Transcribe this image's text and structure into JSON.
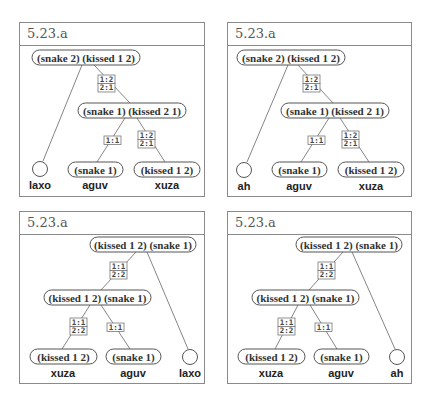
{
  "panels": [
    {
      "title": "5.23.a",
      "box": {
        "x": 19,
        "y": 22,
        "w": 186,
        "h": 175
      },
      "nodes": [
        {
          "id": "top",
          "label": "(snake 2) (kissed 1 2)",
          "x": 32,
          "y": 50,
          "w": 108,
          "h": 15
        },
        {
          "id": "mid",
          "label": "(snake 1) (kissed 2 1)",
          "x": 78,
          "y": 103,
          "w": 108,
          "h": 15
        },
        {
          "id": "b1",
          "label": "(snake 1)",
          "x": 68,
          "y": 162,
          "w": 55,
          "h": 15
        },
        {
          "id": "b2",
          "label": "(kissed 1 2)",
          "x": 134,
          "y": 162,
          "w": 66,
          "h": 15
        }
      ],
      "leaf": {
        "cx": 40,
        "cy": 169,
        "r": 7.5
      },
      "edges": [
        {
          "from": [
            82,
            65
          ],
          "to": [
            43,
            161
          ]
        },
        {
          "from": [
            94,
            65
          ],
          "to": [
            130,
            103
          ]
        },
        {
          "from": [
            125,
            118
          ],
          "to": [
            97,
            162
          ]
        },
        {
          "from": [
            137,
            118
          ],
          "to": [
            165,
            162
          ]
        }
      ],
      "maps": [
        {
          "x": 98,
          "y": 75,
          "lines": [
            "1:2",
            "2:1"
          ]
        },
        {
          "x": 104,
          "y": 136,
          "lines": [
            "1:1"
          ]
        },
        {
          "x": 138,
          "y": 131,
          "lines": [
            "1:2",
            "2:1"
          ]
        }
      ],
      "labels": [
        {
          "text": "laxo",
          "x": 40,
          "y": 189
        },
        {
          "text": "aguv",
          "x": 95,
          "y": 189
        },
        {
          "text": "xuza",
          "x": 167,
          "y": 189
        }
      ]
    },
    {
      "title": "5.23.a",
      "box": {
        "x": 227,
        "y": 22,
        "w": 185,
        "h": 175
      },
      "nodes": [
        {
          "id": "top",
          "label": "(snake 2) (kissed 1 2)",
          "x": 237,
          "y": 50,
          "w": 108,
          "h": 15
        },
        {
          "id": "mid",
          "label": "(snake 1) (kissed 2 1)",
          "x": 281,
          "y": 103,
          "w": 108,
          "h": 15
        },
        {
          "id": "b1",
          "label": "(snake 1)",
          "x": 272,
          "y": 162,
          "w": 55,
          "h": 15
        },
        {
          "id": "b2",
          "label": "(kissed 1 2)",
          "x": 338,
          "y": 162,
          "w": 66,
          "h": 15
        }
      ],
      "leaf": {
        "cx": 244,
        "cy": 170,
        "r": 7.5
      },
      "edges": [
        {
          "from": [
            288,
            65
          ],
          "to": [
            247,
            162
          ]
        },
        {
          "from": [
            298,
            65
          ],
          "to": [
            333,
            103
          ]
        },
        {
          "from": [
            329,
            118
          ],
          "to": [
            301,
            162
          ]
        },
        {
          "from": [
            340,
            118
          ],
          "to": [
            369,
            162
          ]
        }
      ],
      "maps": [
        {
          "x": 303,
          "y": 75,
          "lines": [
            "1:2",
            "2:1"
          ]
        },
        {
          "x": 308,
          "y": 136,
          "lines": [
            "1:1"
          ]
        },
        {
          "x": 342,
          "y": 131,
          "lines": [
            "1:2",
            "2:1"
          ]
        }
      ],
      "labels": [
        {
          "text": "ah",
          "x": 244,
          "y": 190
        },
        {
          "text": "aguv",
          "x": 299,
          "y": 190
        },
        {
          "text": "xuza",
          "x": 371,
          "y": 190
        }
      ]
    },
    {
      "title": "5.23.a",
      "box": {
        "x": 19,
        "y": 211,
        "w": 186,
        "h": 173
      },
      "nodes": [
        {
          "id": "top",
          "label": "(kissed 1 2) (snake 1)",
          "x": 90,
          "y": 237,
          "w": 106,
          "h": 15
        },
        {
          "id": "mid",
          "label": "(kissed 1 2) (snake 1)",
          "x": 44,
          "y": 290,
          "w": 107,
          "h": 15
        },
        {
          "id": "b1",
          "label": "(kissed 1 2)",
          "x": 30,
          "y": 349,
          "w": 67,
          "h": 15
        },
        {
          "id": "b2",
          "label": "(snake 1)",
          "x": 106,
          "y": 349,
          "w": 55,
          "h": 15
        }
      ],
      "leaf": {
        "cx": 190,
        "cy": 357,
        "r": 7.5
      },
      "edges": [
        {
          "from": [
            147,
            252
          ],
          "to": [
            188,
            349
          ]
        },
        {
          "from": [
            136,
            252
          ],
          "to": [
            101,
            290
          ]
        },
        {
          "from": [
            90,
            305
          ],
          "to": [
            62,
            349
          ]
        },
        {
          "from": [
            101,
            305
          ],
          "to": [
            130,
            349
          ]
        }
      ],
      "maps": [
        {
          "x": 110,
          "y": 262,
          "lines": [
            "1:1",
            "2:2"
          ]
        },
        {
          "x": 70,
          "y": 318,
          "lines": [
            "1:1",
            "2:2"
          ]
        },
        {
          "x": 107,
          "y": 323,
          "lines": [
            "1:1"
          ]
        }
      ],
      "labels": [
        {
          "text": "xuza",
          "x": 63,
          "y": 377
        },
        {
          "text": "aguv",
          "x": 133,
          "y": 377
        },
        {
          "text": "laxo",
          "x": 190,
          "y": 377
        }
      ]
    },
    {
      "title": "5.23.a",
      "box": {
        "x": 227,
        "y": 211,
        "w": 185,
        "h": 173
      },
      "nodes": [
        {
          "id": "top",
          "label": "(kissed 1 2) (snake 1)",
          "x": 296,
          "y": 237,
          "w": 106,
          "h": 15
        },
        {
          "id": "mid",
          "label": "(kissed 1 2) (snake 1)",
          "x": 252,
          "y": 290,
          "w": 107,
          "h": 15
        },
        {
          "id": "b1",
          "label": "(kissed 1 2)",
          "x": 238,
          "y": 349,
          "w": 67,
          "h": 15
        },
        {
          "id": "b2",
          "label": "(snake 1)",
          "x": 314,
          "y": 349,
          "w": 55,
          "h": 15
        }
      ],
      "leaf": {
        "cx": 397,
        "cy": 357,
        "r": 7.5
      },
      "edges": [
        {
          "from": [
            352,
            252
          ],
          "to": [
            395,
            349
          ]
        },
        {
          "from": [
            343,
            252
          ],
          "to": [
            309,
            290
          ]
        },
        {
          "from": [
            298,
            305
          ],
          "to": [
            275,
            349
          ]
        },
        {
          "from": [
            310,
            305
          ],
          "to": [
            337,
            349
          ]
        }
      ],
      "maps": [
        {
          "x": 318,
          "y": 262,
          "lines": [
            "1:1",
            "2:2"
          ]
        },
        {
          "x": 278,
          "y": 318,
          "lines": [
            "1:1",
            "2:2"
          ]
        },
        {
          "x": 315,
          "y": 323,
          "lines": [
            "1:1"
          ]
        }
      ],
      "labels": [
        {
          "text": "xuza",
          "x": 271,
          "y": 377
        },
        {
          "text": "aguv",
          "x": 341,
          "y": 377
        },
        {
          "text": "ah",
          "x": 397,
          "y": 377
        }
      ]
    }
  ]
}
